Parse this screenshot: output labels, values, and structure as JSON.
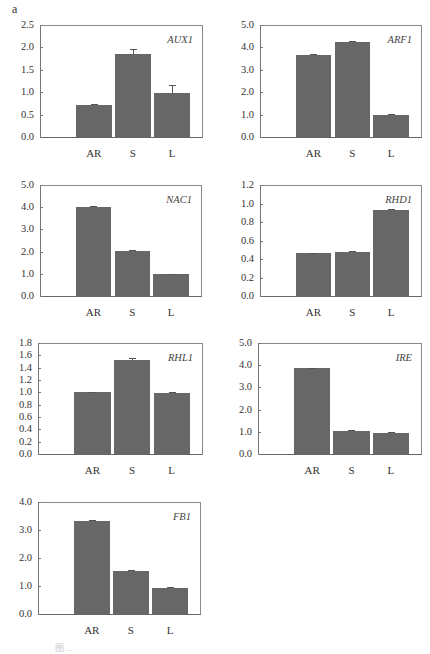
{
  "panel_letter": "a",
  "bar_color": "#676767",
  "categories": [
    "AR",
    "S",
    "L"
  ],
  "chart_data": [
    {
      "type": "bar",
      "title": "AUX1",
      "categories": [
        "AR",
        "S",
        "L"
      ],
      "values": [
        0.72,
        1.86,
        0.99
      ],
      "errors": [
        0.02,
        0.1,
        0.17
      ],
      "ylim": [
        0,
        2.5
      ],
      "yticks": [
        "0.0",
        "0.5",
        "1.0",
        "1.5",
        "2.0",
        "2.5"
      ],
      "xlabel": "",
      "ylabel": "",
      "grid": false
    },
    {
      "type": "bar",
      "title": "ARF1",
      "categories": [
        "AR",
        "S",
        "L"
      ],
      "values": [
        3.68,
        4.24,
        0.97
      ],
      "errors": [
        0.04,
        0.04,
        0.04
      ],
      "ylim": [
        0,
        5.0
      ],
      "yticks": [
        "0.0",
        "1.0",
        "2.0",
        "3.0",
        "4.0",
        "5.0"
      ],
      "xlabel": "",
      "ylabel": "",
      "grid": false
    },
    {
      "type": "bar",
      "title": "NAC1",
      "categories": [
        "AR",
        "S",
        "L"
      ],
      "values": [
        4.02,
        2.02,
        0.97
      ],
      "errors": [
        0.05,
        0.04,
        0.04
      ],
      "ylim": [
        0,
        5.0
      ],
      "yticks": [
        "0.0",
        "1.0",
        "2.0",
        "3.0",
        "4.0",
        "5.0"
      ],
      "xlabel": "",
      "ylabel": "",
      "grid": false
    },
    {
      "type": "bar",
      "title": "RHD1",
      "categories": [
        "AR",
        "S",
        "L"
      ],
      "values": [
        0.46,
        0.48,
        0.93
      ],
      "errors": [
        0.01,
        0.01,
        0.01
      ],
      "ylim": [
        0,
        1.2
      ],
      "yticks": [
        "0.0",
        "0.2",
        "0.4",
        "0.6",
        "0.8",
        "1.0",
        "1.2"
      ],
      "xlabel": "",
      "ylabel": "",
      "grid": false
    },
    {
      "type": "bar",
      "title": "RHL1",
      "categories": [
        "AR",
        "S",
        "L"
      ],
      "values": [
        1.0,
        1.53,
        0.99
      ],
      "errors": [
        0.01,
        0.02,
        0.01
      ],
      "ylim": [
        0,
        1.8
      ],
      "yticks": [
        "0.0",
        "0.2",
        "0.4",
        "0.6",
        "0.8",
        "1.0",
        "1.2",
        "1.4",
        "1.6",
        "1.8"
      ],
      "xlabel": "",
      "ylabel": "",
      "grid": false
    },
    {
      "type": "bar",
      "title": "IRE",
      "categories": [
        "AR",
        "S",
        "L"
      ],
      "values": [
        3.86,
        1.05,
        0.96
      ],
      "errors": [
        0.03,
        0.03,
        0.03
      ],
      "ylim": [
        0,
        5.0
      ],
      "yticks": [
        "0.0",
        "1.0",
        "2.0",
        "3.0",
        "4.0",
        "5.0"
      ],
      "xlabel": "",
      "ylabel": "",
      "grid": false
    },
    {
      "type": "bar",
      "title": "FB1",
      "categories": [
        "AR",
        "S",
        "L"
      ],
      "values": [
        3.32,
        1.55,
        0.93
      ],
      "errors": [
        0.04,
        0.03,
        0.04
      ],
      "ylim": [
        0,
        4.0
      ],
      "yticks": [
        "0.0",
        "1.0",
        "2.0",
        "3.0",
        "4.0"
      ],
      "xlabel": "",
      "ylabel": "",
      "grid": false
    }
  ],
  "layout": [
    {
      "left": 40,
      "top": 25,
      "right": 203,
      "bottom": 138
    },
    {
      "left": 260,
      "top": 25,
      "right": 422,
      "bottom": 138
    },
    {
      "left": 40,
      "top": 185,
      "right": 202,
      "bottom": 297
    },
    {
      "left": 260,
      "top": 185,
      "right": 422,
      "bottom": 297
    },
    {
      "left": 38,
      "top": 343,
      "right": 203,
      "bottom": 455
    },
    {
      "left": 258,
      "top": 343,
      "right": 422,
      "bottom": 455
    },
    {
      "left": 38,
      "top": 502,
      "right": 201,
      "bottom": 615
    }
  ],
  "caption": "图 ..."
}
